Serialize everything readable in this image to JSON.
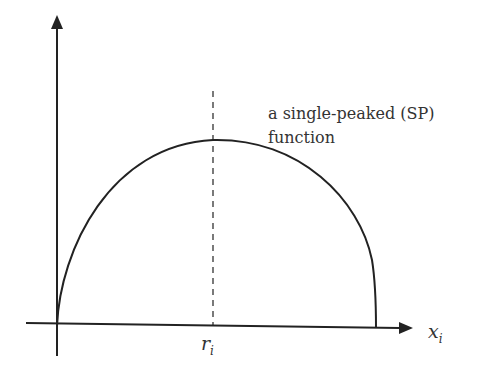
{
  "diagram": {
    "annotation_line1": "a single-peaked (SP)",
    "annotation_line2": "function",
    "peak_label": "r",
    "peak_label_sub": "i",
    "x_axis_label": "x",
    "x_axis_label_sub": "i",
    "colors": {
      "stroke": "#222222",
      "text": "#333333"
    }
  }
}
